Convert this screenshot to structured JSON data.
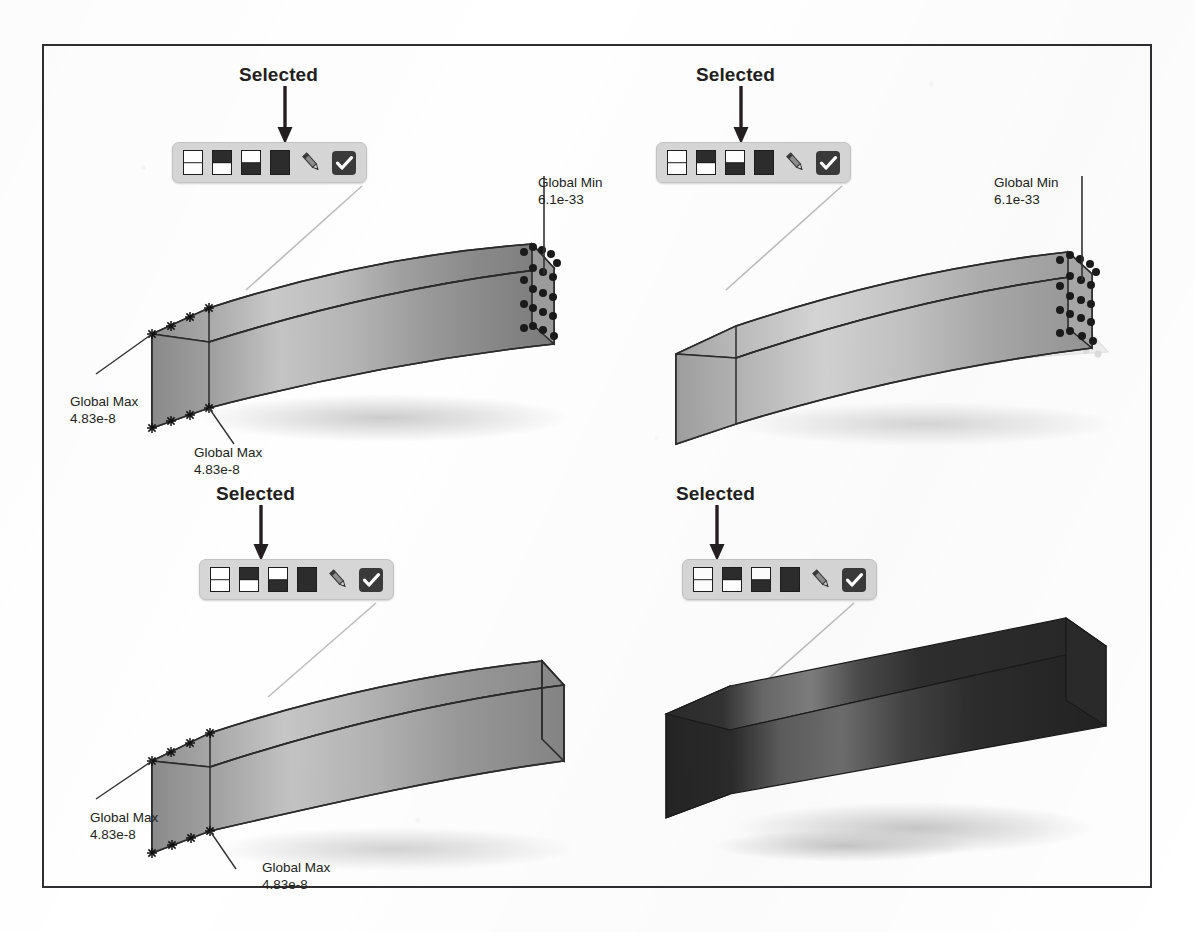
{
  "figure": {
    "border_color": "#2e2e30",
    "background": "#fefefe"
  },
  "toolbar": {
    "bg_color": "#d6d6d6",
    "icons": [
      {
        "name": "display-style-wireframe",
        "type": "split-rect",
        "top": "light",
        "bottom": "light"
      },
      {
        "name": "display-style-shaded-edges",
        "type": "split-rect",
        "top": "dark",
        "bottom": "light"
      },
      {
        "name": "display-style-shaded-no-edges",
        "type": "split-rect",
        "top": "light",
        "bottom": "dark"
      },
      {
        "name": "display-style-solid",
        "type": "split-rect",
        "top": "dark",
        "bottom": "dark"
      },
      {
        "name": "edit-pencil",
        "type": "pencil"
      },
      {
        "name": "apply-check",
        "type": "check"
      }
    ]
  },
  "selected_label": "Selected",
  "panels": [
    {
      "id": "panel-1",
      "selected_index": 3,
      "selected_icon": "display-style-solid",
      "beam_style": "mesh-with-nodes",
      "callouts": [
        {
          "name": "global-min",
          "label": "Global Min",
          "value": "6.1e-33"
        },
        {
          "name": "global-max-upper",
          "label": "Global Max",
          "value": "4.83e-8"
        },
        {
          "name": "global-max-lower",
          "label": "Global Max",
          "value": "4.83e-8"
        }
      ]
    },
    {
      "id": "panel-2",
      "selected_index": 2,
      "selected_icon": "display-style-shaded-no-edges",
      "beam_style": "translucent-with-ghost",
      "callouts": [
        {
          "name": "global-min",
          "label": "Global Min",
          "value": "6.1e-33"
        }
      ]
    },
    {
      "id": "panel-3",
      "selected_index": 1,
      "selected_icon": "display-style-shaded-edges",
      "beam_style": "shaded-wireframe",
      "callouts": [
        {
          "name": "global-max-upper",
          "label": "Global Max",
          "value": "4.83e-8"
        },
        {
          "name": "global-max-lower",
          "label": "Global Max",
          "value": "4.83e-8"
        }
      ]
    },
    {
      "id": "panel-4",
      "selected_index": 0,
      "selected_icon": "display-style-wireframe",
      "beam_style": "solid-dark",
      "callouts": []
    }
  ],
  "colors": {
    "ink": "#231f20",
    "toolbar_bg": "#d6d6d6",
    "icon_dark": "#2c2c2c",
    "leader": "#b9b9b9",
    "beam_edge": "#2b2b2b",
    "shadow": "#cfcfcf"
  }
}
